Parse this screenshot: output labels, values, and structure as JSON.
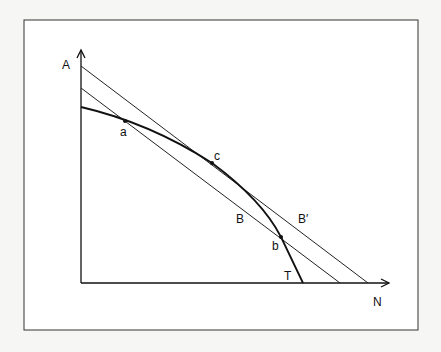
{
  "labels": {
    "y_axis": "A",
    "x_axis": "N",
    "point_a": "a",
    "point_b": "b",
    "point_c": "c",
    "line_B": "B",
    "line_B_prime": "B′",
    "curve_T": "T"
  }
}
